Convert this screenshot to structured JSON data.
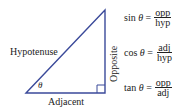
{
  "diagram": {
    "colors": {
      "triangle": "#3b4a9a",
      "text": "#222222"
    },
    "labels": {
      "hypotenuse": "Hypotenuse",
      "opposite": "Opposite",
      "adjacent": "Adjacent",
      "angle": "θ"
    },
    "formulas": [
      {
        "func": "sin",
        "var": "θ",
        "eq": "=",
        "num": "opp",
        "den": "hyp"
      },
      {
        "func": "cos",
        "var": "θ",
        "eq": "=",
        "num": "adj",
        "den": "hyp"
      },
      {
        "func": "tan",
        "var": "θ",
        "eq": "=",
        "num": "opp",
        "den": "adj"
      }
    ]
  }
}
